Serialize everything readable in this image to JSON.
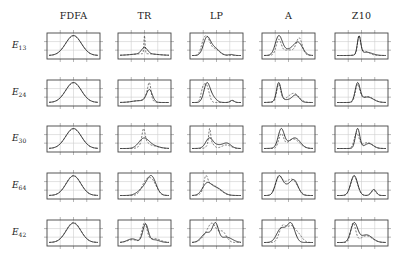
{
  "chart_data": {
    "type": "line",
    "layout": "grid 5x5 small multiples",
    "columns": [
      "FDFA",
      "TR",
      "LP",
      "A",
      "Z10"
    ],
    "rows": [
      {
        "label": "E",
        "sub": "13"
      },
      {
        "label": "E",
        "sub": "24"
      },
      {
        "label": "E",
        "sub": "30"
      },
      {
        "label": "E",
        "sub": "64"
      },
      {
        "label": "E",
        "sub": "42"
      }
    ],
    "grid": true,
    "series_styles": [
      {
        "name": "solid",
        "stroke": "#222222",
        "dash": ""
      },
      {
        "name": "dashed",
        "stroke": "#555555",
        "dash": "2,1.5"
      }
    ],
    "panels": [
      [
        {
          "solid": [
            [
              0.5,
              0.16,
              1.0
            ]
          ],
          "dashed": [
            [
              0.5,
              0.16,
              0.98
            ]
          ]
        },
        {
          "solid": [
            [
              0.5,
              0.06,
              0.35
            ],
            [
              0.5,
              0.25,
              0.1
            ]
          ],
          "dashed": [
            [
              0.5,
              0.012,
              1.0
            ],
            [
              0.5,
              0.25,
              0.1
            ]
          ]
        },
        {
          "solid": [
            [
              0.3,
              0.07,
              0.95
            ],
            [
              0.45,
              0.1,
              0.45
            ],
            [
              0.8,
              0.05,
              0.06
            ]
          ],
          "dashed": [
            [
              0.22,
              0.05,
              0.45
            ],
            [
              0.3,
              0.06,
              0.9
            ],
            [
              0.45,
              0.1,
              0.4
            ]
          ]
        },
        {
          "solid": [
            [
              0.3,
              0.07,
              0.95
            ],
            [
              0.7,
              0.09,
              0.6
            ],
            [
              0.5,
              0.15,
              0.3
            ]
          ],
          "dashed": [
            [
              0.3,
              0.05,
              0.75
            ],
            [
              0.72,
              0.06,
              0.85
            ],
            [
              0.5,
              0.15,
              0.3
            ]
          ]
        },
        {
          "solid": [
            [
              0.45,
              0.035,
              1.0
            ],
            [
              0.6,
              0.12,
              0.18
            ]
          ],
          "dashed": [
            [
              0.45,
              0.03,
              0.95
            ],
            [
              0.55,
              0.1,
              0.25
            ]
          ]
        }
      ],
      [
        {
          "solid": [
            [
              0.5,
              0.16,
              1.0
            ]
          ],
          "dashed": [
            [
              0.5,
              0.16,
              0.98
            ]
          ]
        },
        {
          "solid": [
            [
              0.6,
              0.06,
              1.0
            ],
            [
              0.4,
              0.15,
              0.15
            ]
          ],
          "dashed": [
            [
              0.6,
              0.03,
              1.05
            ],
            [
              0.57,
              0.06,
              0.6
            ],
            [
              0.4,
              0.15,
              0.15
            ]
          ]
        },
        {
          "solid": [
            [
              0.3,
              0.06,
              0.95
            ],
            [
              0.4,
              0.08,
              0.35
            ],
            [
              0.82,
              0.04,
              0.12
            ]
          ],
          "dashed": [
            [
              0.22,
              0.04,
              0.65
            ],
            [
              0.3,
              0.05,
              0.9
            ],
            [
              0.82,
              0.04,
              0.1
            ]
          ]
        },
        {
          "solid": [
            [
              0.3,
              0.045,
              1.0
            ],
            [
              0.65,
              0.07,
              0.35
            ],
            [
              0.45,
              0.15,
              0.15
            ]
          ],
          "dashed": [
            [
              0.3,
              0.04,
              0.9
            ],
            [
              0.62,
              0.1,
              0.42
            ],
            [
              0.45,
              0.15,
              0.15
            ]
          ]
        },
        {
          "solid": [
            [
              0.42,
              0.05,
              0.95
            ],
            [
              0.62,
              0.12,
              0.28
            ]
          ],
          "dashed": [
            [
              0.42,
              0.045,
              0.85
            ],
            [
              0.62,
              0.12,
              0.3
            ]
          ]
        }
      ],
      [
        {
          "solid": [
            [
              0.5,
              0.16,
              1.0
            ]
          ],
          "dashed": [
            [
              0.5,
              0.16,
              0.98
            ]
          ]
        },
        {
          "solid": [
            [
              0.48,
              0.1,
              0.55
            ],
            [
              0.62,
              0.15,
              0.2
            ]
          ],
          "dashed": [
            [
              0.48,
              0.03,
              0.85
            ],
            [
              0.5,
              0.08,
              0.45
            ],
            [
              0.7,
              0.1,
              0.15
            ]
          ]
        },
        {
          "solid": [
            [
              0.35,
              0.07,
              0.6
            ],
            [
              0.72,
              0.08,
              0.3
            ],
            [
              0.5,
              0.15,
              0.25
            ]
          ],
          "dashed": [
            [
              0.36,
              0.02,
              1.0
            ],
            [
              0.38,
              0.06,
              0.45
            ],
            [
              0.7,
              0.09,
              0.25
            ]
          ]
        },
        {
          "solid": [
            [
              0.35,
              0.06,
              1.0
            ],
            [
              0.65,
              0.1,
              0.45
            ],
            [
              0.5,
              0.15,
              0.25
            ]
          ],
          "dashed": [
            [
              0.35,
              0.05,
              0.8
            ],
            [
              0.6,
              0.12,
              0.55
            ]
          ]
        },
        {
          "solid": [
            [
              0.42,
              0.045,
              1.0
            ],
            [
              0.65,
              0.09,
              0.25
            ]
          ],
          "dashed": [
            [
              0.4,
              0.05,
              0.75
            ],
            [
              0.62,
              0.1,
              0.3
            ]
          ]
        }
      ],
      [
        {
          "solid": [
            [
              0.5,
              0.15,
              1.0
            ]
          ],
          "dashed": [
            [
              0.5,
              0.15,
              1.02
            ]
          ]
        },
        {
          "solid": [
            [
              0.65,
              0.09,
              1.0
            ],
            [
              0.5,
              0.12,
              0.45
            ]
          ],
          "dashed": [
            [
              0.64,
              0.1,
              0.95
            ],
            [
              0.5,
              0.08,
              0.5
            ]
          ]
        },
        {
          "solid": [
            [
              0.3,
              0.09,
              0.75
            ],
            [
              0.5,
              0.12,
              0.5
            ]
          ],
          "dashed": [
            [
              0.28,
              0.04,
              0.85
            ],
            [
              0.35,
              0.1,
              0.55
            ],
            [
              0.5,
              0.12,
              0.4
            ]
          ]
        },
        {
          "solid": [
            [
              0.3,
              0.07,
              1.0
            ],
            [
              0.62,
              0.08,
              0.8
            ],
            [
              0.45,
              0.1,
              0.5
            ]
          ],
          "dashed": [
            [
              0.3,
              0.07,
              0.95
            ],
            [
              0.6,
              0.1,
              0.75
            ],
            [
              0.45,
              0.1,
              0.5
            ]
          ]
        },
        {
          "solid": [
            [
              0.35,
              0.07,
              1.0
            ],
            [
              0.75,
              0.05,
              0.3
            ]
          ],
          "dashed": [
            [
              0.35,
              0.07,
              0.95
            ],
            [
              0.75,
              0.05,
              0.25
            ]
          ]
        }
      ],
      [
        {
          "solid": [
            [
              0.5,
              0.15,
              1.0
            ]
          ],
          "dashed": [
            [
              0.5,
              0.15,
              1.03
            ]
          ]
        },
        {
          "solid": [
            [
              0.52,
              0.055,
              1.0
            ],
            [
              0.25,
              0.1,
              0.2
            ],
            [
              0.7,
              0.1,
              0.15
            ]
          ],
          "dashed": [
            [
              0.5,
              0.05,
              1.05
            ],
            [
              0.25,
              0.1,
              0.15
            ],
            [
              0.7,
              0.12,
              0.22
            ]
          ]
        },
        {
          "solid": [
            [
              0.48,
              0.06,
              0.95
            ],
            [
              0.3,
              0.1,
              0.55
            ],
            [
              0.7,
              0.12,
              0.3
            ]
          ],
          "dashed": [
            [
              0.42,
              0.08,
              0.85
            ],
            [
              0.62,
              0.08,
              0.6
            ],
            [
              0.3,
              0.1,
              0.4
            ]
          ]
        },
        {
          "solid": [
            [
              0.55,
              0.08,
              1.0
            ],
            [
              0.35,
              0.09,
              0.75
            ]
          ],
          "dashed": [
            [
              0.38,
              0.07,
              0.85
            ],
            [
              0.55,
              0.08,
              0.8
            ],
            [
              0.7,
              0.08,
              0.4
            ]
          ]
        },
        {
          "solid": [
            [
              0.35,
              0.07,
              1.0
            ],
            [
              0.6,
              0.12,
              0.4
            ]
          ],
          "dashed": [
            [
              0.33,
              0.05,
              1.0
            ],
            [
              0.6,
              0.12,
              0.35
            ]
          ]
        }
      ]
    ],
    "panel_geometry": {
      "col_x": [
        47,
        118,
        190,
        262,
        335
      ],
      "row_y": [
        33,
        80,
        126,
        173,
        220
      ],
      "width": 53,
      "height": 26
    },
    "xlabel": "",
    "ylabel": ""
  }
}
